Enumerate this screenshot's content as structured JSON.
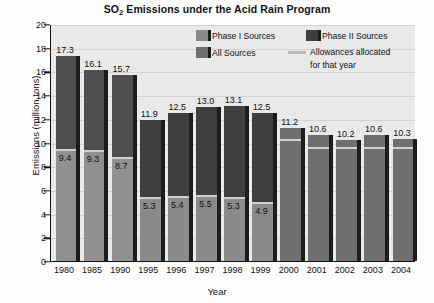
{
  "chart_data": {
    "type": "bar",
    "title": "SO2 Emissions under the Acid Rain Program",
    "title_main": "SO",
    "title_sub": "2",
    "title_rest": " Emissions under the Acid Rain Program",
    "xlabel": "Year",
    "ylabel": "Emissions (million tons)",
    "ylim": [
      0,
      20
    ],
    "yticks": [
      0,
      2,
      4,
      6,
      8,
      10,
      12,
      14,
      16,
      18,
      20
    ],
    "grid": true,
    "legend_position": "top-right",
    "categories": [
      "1980",
      "1985",
      "1990",
      "1995",
      "1996",
      "1997",
      "1998",
      "1999",
      "2000",
      "2001",
      "2002",
      "2003",
      "2004"
    ],
    "values": [
      17.3,
      16.1,
      15.7,
      11.9,
      12.5,
      13.0,
      13.1,
      12.5,
      11.2,
      10.6,
      10.2,
      10.6,
      10.3
    ],
    "allowances": [
      9.4,
      9.3,
      8.7,
      5.3,
      5.4,
      5.5,
      5.3,
      4.9,
      10.2,
      9.5,
      9.5,
      9.5,
      9.5
    ],
    "allowance_labels": [
      "9.4",
      "9.3",
      "8.7",
      "5.3",
      "5.4",
      "5.5",
      "5.3",
      "4.9",
      "",
      "",
      "",
      "",
      ""
    ],
    "series_of_bar": [
      "phase1",
      "phase1",
      "phase1",
      "phase2",
      "phase2",
      "phase2",
      "phase2",
      "phase2",
      "all",
      "all",
      "all",
      "all",
      "all"
    ],
    "series": [
      {
        "name": "Phase I Sources",
        "color": "#8a8a8a",
        "key": "phase1"
      },
      {
        "name": "Phase II Sources",
        "color": "#4a4a4a",
        "key": "phase2"
      },
      {
        "name": "All Sources",
        "color": "#6f6f6f",
        "key": "all"
      },
      {
        "name": "Allowances allocated for that year",
        "color": "#b9b9b9",
        "key": "allowance",
        "marker": "line"
      }
    ]
  },
  "legend": {
    "items": [
      {
        "label": "Phase I Sources",
        "type": "swatch"
      },
      {
        "label": "Phase II Sources",
        "type": "swatch"
      },
      {
        "label": "All Sources",
        "type": "swatch"
      },
      {
        "label": "Allowances allocated",
        "label2": "for that year",
        "type": "line"
      }
    ]
  },
  "colors": {
    "plot_bg": "#e9e9e9",
    "grid": "#d2d2d2",
    "axis": "#111111",
    "bar_upper": "#4f4f4f",
    "bar_lower": "#909090",
    "bar_phase2_upper": "#3f3f3f",
    "bar_phase2_lower": "#8b8b8b",
    "bar_all": "#6f6f6f",
    "bar_side": "#1c1c1c",
    "allowance_line": "#cfcfcf"
  }
}
